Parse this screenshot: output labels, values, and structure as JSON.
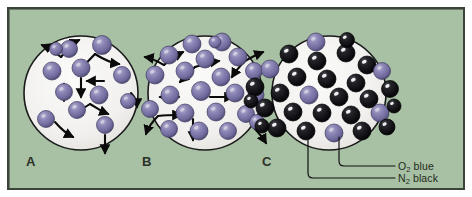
{
  "figure": {
    "type": "scientific-diagram",
    "background_color": "#a8c0a4",
    "frame_border_color": "#3b4438",
    "container_fill_color": "#f2f1ef",
    "container_outline_color": "#1a1a1a",
    "o2_color": "#7b76a8",
    "n2_color": "#0d0d12",
    "arrow_color": "#0a0a0a",
    "label_color": "#2b3229"
  },
  "panels": [
    {
      "id": "A",
      "label": "A",
      "label_x": 17,
      "label_y": 145,
      "center_x": 72,
      "center_y": 84,
      "radius": 57,
      "description": "Low density gas, few molecules with motion arrows",
      "molecule_count": 12,
      "molecules": [
        {
          "x": 60,
          "y": 40,
          "r": 8.5,
          "species": "O2"
        },
        {
          "x": 93,
          "y": 36,
          "r": 9.5,
          "species": "O2"
        },
        {
          "x": 72,
          "y": 59,
          "r": 9.0,
          "species": "O2"
        },
        {
          "x": 43,
          "y": 62,
          "r": 9.0,
          "species": "O2"
        },
        {
          "x": 113,
          "y": 66,
          "r": 8.5,
          "species": "O2"
        },
        {
          "x": 55,
          "y": 83,
          "r": 8.5,
          "species": "O2"
        },
        {
          "x": 90,
          "y": 86,
          "r": 9.0,
          "species": "O2"
        },
        {
          "x": 68,
          "y": 101,
          "r": 8.5,
          "species": "O2"
        },
        {
          "x": 37,
          "y": 110,
          "r": 8.5,
          "species": "O2"
        },
        {
          "x": 96,
          "y": 116,
          "r": 8.5,
          "species": "O2"
        },
        {
          "x": 119,
          "y": 92,
          "r": 7.5,
          "species": "O2"
        },
        {
          "x": 47,
          "y": 40,
          "r": 6.5,
          "species": "O2"
        }
      ]
    },
    {
      "id": "B",
      "label": "B",
      "label_x": 133,
      "label_y": 145,
      "center_x": 196,
      "center_y": 84,
      "radius": 57,
      "description": "Higher density gas, many molecules with motion arrows",
      "molecule_count": 22,
      "molecules": [
        {
          "x": 183,
          "y": 35,
          "r": 9.0,
          "species": "O2"
        },
        {
          "x": 213,
          "y": 33,
          "r": 9.0,
          "species": "O2"
        },
        {
          "x": 160,
          "y": 46,
          "r": 9.0,
          "species": "O2"
        },
        {
          "x": 196,
          "y": 50,
          "r": 9.0,
          "species": "O2"
        },
        {
          "x": 229,
          "y": 48,
          "r": 9.0,
          "species": "O2"
        },
        {
          "x": 245,
          "y": 62,
          "r": 8.5,
          "species": "O2"
        },
        {
          "x": 176,
          "y": 62,
          "r": 9.0,
          "species": "O2"
        },
        {
          "x": 146,
          "y": 66,
          "r": 9.0,
          "species": "O2"
        },
        {
          "x": 212,
          "y": 68,
          "r": 9.0,
          "species": "O2"
        },
        {
          "x": 192,
          "y": 82,
          "r": 9.5,
          "species": "O2"
        },
        {
          "x": 226,
          "y": 84,
          "r": 9.0,
          "species": "O2"
        },
        {
          "x": 161,
          "y": 86,
          "r": 9.0,
          "species": "O2"
        },
        {
          "x": 247,
          "y": 86,
          "r": 8.0,
          "species": "O2"
        },
        {
          "x": 141,
          "y": 100,
          "r": 8.5,
          "species": "O2"
        },
        {
          "x": 176,
          "y": 104,
          "r": 9.0,
          "species": "O2"
        },
        {
          "x": 207,
          "y": 103,
          "r": 9.0,
          "species": "O2"
        },
        {
          "x": 237,
          "y": 105,
          "r": 8.5,
          "species": "O2"
        },
        {
          "x": 160,
          "y": 120,
          "r": 8.5,
          "species": "O2"
        },
        {
          "x": 190,
          "y": 122,
          "r": 9.0,
          "species": "O2"
        },
        {
          "x": 219,
          "y": 122,
          "r": 8.5,
          "species": "O2"
        },
        {
          "x": 248,
          "y": 113,
          "r": 7.5,
          "species": "O2"
        },
        {
          "x": 206,
          "y": 33,
          "r": 6.0,
          "species": "O2"
        }
      ]
    },
    {
      "id": "C",
      "label": "C",
      "label_x": 253,
      "label_y": 145,
      "center_x": 320,
      "center_y": 84,
      "radius": 57,
      "description": "Dense mixture of nitrogen (black) and oxygen (blue) molecules",
      "molecule_count": 30,
      "molecules": [
        {
          "x": 307,
          "y": 33,
          "r": 9.0,
          "species": "O2"
        },
        {
          "x": 280,
          "y": 45,
          "r": 9.0,
          "species": "N2"
        },
        {
          "x": 308,
          "y": 52,
          "r": 9.0,
          "species": "N2"
        },
        {
          "x": 337,
          "y": 44,
          "r": 9.0,
          "species": "N2"
        },
        {
          "x": 358,
          "y": 56,
          "r": 9.0,
          "species": "N2"
        },
        {
          "x": 261,
          "y": 60,
          "r": 9.0,
          "species": "O2"
        },
        {
          "x": 288,
          "y": 68,
          "r": 9.0,
          "species": "N2"
        },
        {
          "x": 318,
          "y": 70,
          "r": 9.0,
          "species": "N2"
        },
        {
          "x": 347,
          "y": 74,
          "r": 9.0,
          "species": "N2"
        },
        {
          "x": 373,
          "y": 62,
          "r": 8.5,
          "species": "O2"
        },
        {
          "x": 246,
          "y": 78,
          "r": 9.0,
          "species": "N2"
        },
        {
          "x": 271,
          "y": 84,
          "r": 9.0,
          "species": "N2"
        },
        {
          "x": 300,
          "y": 86,
          "r": 9.0,
          "species": "O2"
        },
        {
          "x": 330,
          "y": 88,
          "r": 9.0,
          "species": "N2"
        },
        {
          "x": 360,
          "y": 90,
          "r": 9.0,
          "species": "N2"
        },
        {
          "x": 381,
          "y": 80,
          "r": 8.5,
          "species": "N2"
        },
        {
          "x": 256,
          "y": 99,
          "r": 9.0,
          "species": "N2"
        },
        {
          "x": 284,
          "y": 103,
          "r": 9.0,
          "species": "N2"
        },
        {
          "x": 313,
          "y": 104,
          "r": 9.0,
          "species": "N2"
        },
        {
          "x": 342,
          "y": 106,
          "r": 9.0,
          "species": "N2"
        },
        {
          "x": 371,
          "y": 104,
          "r": 9.0,
          "species": "O2"
        },
        {
          "x": 268,
          "y": 119,
          "r": 9.0,
          "species": "N2"
        },
        {
          "x": 297,
          "y": 122,
          "r": 9.0,
          "species": "N2"
        },
        {
          "x": 325,
          "y": 124,
          "r": 9.0,
          "species": "O2"
        },
        {
          "x": 353,
          "y": 122,
          "r": 9.0,
          "species": "N2"
        },
        {
          "x": 378,
          "y": 118,
          "r": 8.0,
          "species": "N2"
        },
        {
          "x": 253,
          "y": 117,
          "r": 7.0,
          "species": "N2"
        },
        {
          "x": 338,
          "y": 31,
          "r": 7.5,
          "species": "N2"
        },
        {
          "x": 385,
          "y": 97,
          "r": 7.0,
          "species": "N2"
        },
        {
          "x": 242,
          "y": 92,
          "r": 7.0,
          "species": "N2"
        }
      ]
    }
  ],
  "legend": {
    "items": [
      {
        "id": "o2",
        "formula": "O",
        "subscript": "2",
        "color_word": "blue",
        "text_x": 389,
        "text_y": 152,
        "leader_from_x": 330,
        "leader_from_y": 128,
        "leader_to_x": 386,
        "leader_to_y": 157
      },
      {
        "id": "n2",
        "formula": "N",
        "subscript": "2",
        "color_word": "black",
        "text_x": 389,
        "text_y": 164,
        "leader_from_x": 299,
        "leader_from_y": 128,
        "leader_to_x": 386,
        "leader_to_y": 169
      }
    ]
  },
  "motion_arrows": {
    "description": "Curved and straight arrows indicating random molecular motion",
    "panel_a": [
      {
        "path": "M 52 48 C 44 42 38 38 33 36",
        "head_angle": 205
      },
      {
        "path": "M 52 48 C 58 40 64 34 70 31",
        "head_angle": 330
      },
      {
        "path": "M 86 45 C 94 50 102 54 110 55",
        "head_angle": 25
      },
      {
        "path": "M 86 45 C 80 52 74 57 70 60",
        "head_angle": 135
      },
      {
        "path": "M 72 69 C 72 76 72 82 72 88",
        "head_angle": 90
      },
      {
        "path": "M 95 72 C 89 72 83 72 78 72",
        "head_angle": 180
      },
      {
        "path": "M 55 92 C 55 86 55 80 55 75",
        "head_angle": 270
      },
      {
        "path": "M 81 95 C 75 99 70 102 65 103",
        "head_angle": 185
      },
      {
        "path": "M 81 95 C 88 99 94 103 99 105",
        "head_angle": 30
      },
      {
        "path": "M 46 113 C 52 120 58 125 64 128",
        "head_angle": 35
      },
      {
        "path": "M 96 126 C 96 133 96 139 96 144",
        "head_angle": 90
      },
      {
        "path": "M 122 84 C 126 88 128 93 128 98",
        "head_angle": 75
      }
    ],
    "panel_b": [
      {
        "path": "M 155 56 C 148 52 142 49 136 48",
        "head_angle": 200
      },
      {
        "path": "M 155 56 C 162 50 168 46 174 43",
        "head_angle": 325
      },
      {
        "path": "M 186 58 C 194 55 202 53 210 52",
        "head_angle": 10
      },
      {
        "path": "M 186 58 C 180 64 175 69 171 73",
        "head_angle": 140
      },
      {
        "path": "M 236 52 C 243 48 249 45 254 43",
        "head_angle": 330
      },
      {
        "path": "M 236 52 C 230 58 226 63 223 68",
        "head_angle": 140
      },
      {
        "path": "M 201 88 C 209 88 217 88 224 88",
        "head_angle": 0
      },
      {
        "path": "M 170 88 C 163 88 157 88 151 88",
        "head_angle": 180
      },
      {
        "path": "M 149 107 C 143 113 139 119 137 125",
        "head_angle": 115
      },
      {
        "path": "M 149 107 C 157 106 165 106 172 106",
        "head_angle": 0
      },
      {
        "path": "M 184 110 C 184 118 184 125 184 131",
        "head_angle": 90
      },
      {
        "path": "M 244 118 C 250 124 254 129 257 134",
        "head_angle": 50
      }
    ]
  }
}
